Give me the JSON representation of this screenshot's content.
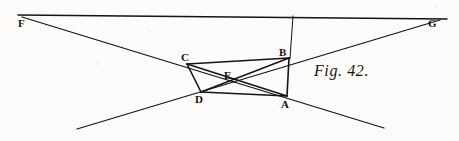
{
  "figure": {
    "caption": "Fig. 42.",
    "caption_pos": {
      "x": 314,
      "y": 62
    },
    "width": 459,
    "height": 141,
    "ink_color": "#161310",
    "paper_color": "#fdfcfa"
  },
  "points": {
    "A": {
      "label": "A",
      "x": 287,
      "y": 96,
      "label_x": 281,
      "label_y": 99
    },
    "B": {
      "label": "B",
      "x": 289,
      "y": 58,
      "label_x": 279,
      "label_y": 47
    },
    "C": {
      "label": "C",
      "x": 187,
      "y": 64,
      "label_x": 181,
      "label_y": 52
    },
    "D": {
      "label": "D",
      "x": 201,
      "y": 92,
      "label_x": 195,
      "label_y": 94
    },
    "E": {
      "label": "E",
      "x": 231,
      "y": 78,
      "label_x": 224,
      "label_y": 70
    },
    "F": {
      "label": "F",
      "x": 22,
      "y": 16,
      "label_x": 18,
      "label_y": 18
    },
    "G": {
      "label": "G",
      "x": 438,
      "y": 19,
      "label_x": 428,
      "label_y": 18
    }
  },
  "segments": [
    {
      "name": "line-FG-top-horizontal",
      "from": [
        18,
        15
      ],
      "to": [
        447,
        19
      ],
      "width": 1.5
    },
    {
      "name": "line-F-through-C-to-A-extended",
      "from": [
        22,
        17
      ],
      "to": [
        384,
        128
      ],
      "width": 1.3
    },
    {
      "name": "line-G-through-B-to-D-extended",
      "from": [
        440,
        20
      ],
      "to": [
        77,
        129
      ],
      "width": 1.3
    },
    {
      "name": "line-vertical-from-FG-to-B",
      "from": [
        293,
        16
      ],
      "to": [
        290,
        59
      ],
      "width": 1.0
    },
    {
      "name": "edge-CB",
      "from": [
        187,
        64
      ],
      "to": [
        289,
        58
      ],
      "width": 1.6
    },
    {
      "name": "edge-BA",
      "from": [
        289,
        58
      ],
      "to": [
        287,
        96
      ],
      "width": 1.6
    },
    {
      "name": "edge-AD",
      "from": [
        287,
        96
      ],
      "to": [
        201,
        92
      ],
      "width": 1.6
    },
    {
      "name": "edge-DC",
      "from": [
        201,
        92
      ],
      "to": [
        187,
        64
      ],
      "width": 1.6
    },
    {
      "name": "diagonal-CA",
      "from": [
        187,
        64
      ],
      "to": [
        287,
        96
      ],
      "width": 1.4
    },
    {
      "name": "diagonal-DB",
      "from": [
        201,
        92
      ],
      "to": [
        289,
        58
      ],
      "width": 1.4
    }
  ],
  "labels": [
    {
      "key": "F",
      "text": "F"
    },
    {
      "key": "G",
      "text": "G"
    },
    {
      "key": "C",
      "text": "C"
    },
    {
      "key": "B",
      "text": "B"
    },
    {
      "key": "D",
      "text": "D"
    },
    {
      "key": "A",
      "text": "A"
    },
    {
      "key": "E",
      "text": "E"
    }
  ]
}
